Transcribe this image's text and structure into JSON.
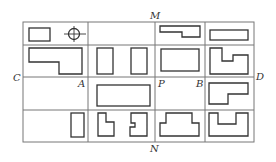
{
  "diagram": {
    "type": "grid-layout-plan",
    "labels": {
      "M": "M",
      "N": "N",
      "C": "C",
      "D": "D",
      "A": "A",
      "B": "B",
      "P": "P"
    },
    "grid": {
      "columns": 4,
      "rows": 4,
      "col_lines_x": [
        23,
        88,
        155,
        205,
        254
      ],
      "row_lines_y": [
        22,
        45,
        77,
        110,
        142
      ]
    },
    "cells": [
      {
        "row": 0,
        "col": 0,
        "content": [
          "rectangle",
          "crosshair-circle"
        ]
      },
      {
        "row": 0,
        "col": 1,
        "content": []
      },
      {
        "row": 0,
        "col": 2,
        "content": [
          "stepped-bar"
        ]
      },
      {
        "row": 0,
        "col": 3,
        "content": [
          "rectangle"
        ]
      },
      {
        "row": 1,
        "col": 0,
        "content": [
          "L-shape"
        ]
      },
      {
        "row": 1,
        "col": 1,
        "content": [
          "rectangle",
          "rectangle"
        ]
      },
      {
        "row": 1,
        "col": 2,
        "content": [
          "rectangle"
        ]
      },
      {
        "row": 1,
        "col": 3,
        "content": [
          "notched-shape"
        ]
      },
      {
        "row": 2,
        "col": 0,
        "content": []
      },
      {
        "row": 2,
        "col": 1,
        "content": [
          "rectangle"
        ]
      },
      {
        "row": 2,
        "col": 2,
        "content": []
      },
      {
        "row": 2,
        "col": 3,
        "content": [
          "L-shape"
        ]
      },
      {
        "row": 3,
        "col": 0,
        "content": [
          "rectangle"
        ]
      },
      {
        "row": 3,
        "col": 1,
        "content": [
          "L-shape",
          "L-shape-mirrored"
        ]
      },
      {
        "row": 3,
        "col": 2,
        "content": [
          "T-shape"
        ]
      },
      {
        "row": 3,
        "col": 3,
        "content": [
          "U-shape"
        ]
      }
    ],
    "colors": {
      "grid_line": "#777777",
      "shape_line": "#333333",
      "background": "#ffffff"
    }
  }
}
